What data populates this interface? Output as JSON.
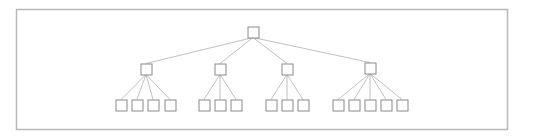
{
  "diagram": {
    "type": "tree",
    "frame": {
      "x": 16,
      "y": 9,
      "w": 491,
      "h": 120,
      "stroke": "#b8b8b8"
    },
    "box_size": 11,
    "box_stroke": "#8a8a8a",
    "edge_stroke": "#b0b0b0",
    "root": {
      "cx": 253,
      "cy": 32
    },
    "children": [
      {
        "cx": 146,
        "cy": 69,
        "leaves": [
          121,
          137,
          153,
          170
        ]
      },
      {
        "cx": 220,
        "cy": 69,
        "leaves": [
          204,
          220,
          236
        ]
      },
      {
        "cx": 287,
        "cy": 69,
        "leaves": [
          271,
          287,
          303
        ]
      },
      {
        "cx": 370,
        "cy": 68,
        "leaves": [
          338,
          354,
          370,
          386,
          402
        ]
      }
    ],
    "leaf_cy": 105
  }
}
